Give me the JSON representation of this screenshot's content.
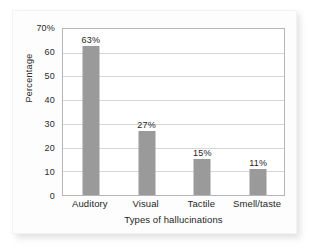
{
  "figure": {
    "background_color": "#ffffff",
    "card_color": "#fdfdfd",
    "bar_color": "#9a9a9a",
    "gridline_color": "#d6d6d6",
    "axis_color": "#b6b6b6"
  },
  "chart_data": {
    "type": "bar",
    "title": "",
    "xlabel": "Types of hallucinations",
    "ylabel": "Percentage",
    "categories": [
      "Auditory",
      "Visual",
      "Tactile",
      "Smell/taste"
    ],
    "values": [
      63,
      27,
      15,
      11
    ],
    "data_labels": [
      "63%",
      "27%",
      "15%",
      "11%"
    ],
    "ylim": [
      0,
      70
    ],
    "ytick_values": [
      70,
      60,
      50,
      40,
      30,
      20,
      10,
      0
    ],
    "ytick_labels": [
      "70%",
      "60",
      "50",
      "40",
      "30",
      "20",
      "10",
      "0"
    ],
    "grid": "horizontal",
    "legend": "none"
  }
}
